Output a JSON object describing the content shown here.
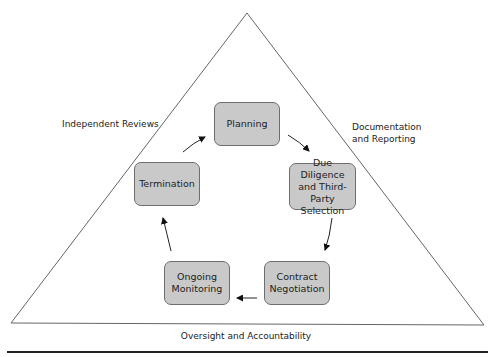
{
  "diagram": {
    "type": "lifecycle-cycle-in-triangle",
    "triangle_sides": {
      "left": "Independent Reviews",
      "right": "Documentation and Reporting",
      "right_line1": "Documentation",
      "right_line2": "and Reporting",
      "base": "Oversight and Accountability"
    },
    "stages": [
      {
        "id": "planning",
        "label": "Planning"
      },
      {
        "id": "due-diligence",
        "label": "Due Diligence and Third-Party Selection",
        "line1": "Due Diligence",
        "line2": "and Third-Party",
        "line3": "Selection"
      },
      {
        "id": "contract-negotiation",
        "label": "Contract Negotiation",
        "line1": "Contract",
        "line2": "Negotiation"
      },
      {
        "id": "ongoing-monitoring",
        "label": "Ongoing Monitoring",
        "line1": "Ongoing",
        "line2": "Monitoring"
      },
      {
        "id": "termination",
        "label": "Termination"
      }
    ],
    "flow": [
      [
        "planning",
        "due-diligence"
      ],
      [
        "due-diligence",
        "contract-negotiation"
      ],
      [
        "contract-negotiation",
        "ongoing-monitoring"
      ],
      [
        "ongoing-monitoring",
        "termination"
      ],
      [
        "termination",
        "planning"
      ]
    ],
    "colors": {
      "box_fill": "#c9c9c9",
      "box_border": "#6e6e6e",
      "line": "#555555",
      "text": "#222222"
    }
  }
}
